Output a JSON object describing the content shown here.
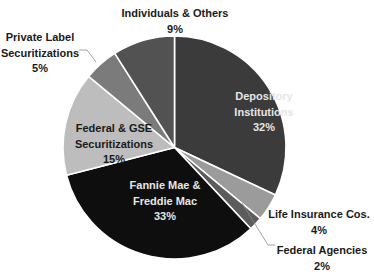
{
  "chart_data": {
    "type": "pie",
    "title": "",
    "start_angle_deg": 0,
    "direction": "clockwise",
    "slices": [
      {
        "label": "Depository Institutions",
        "lines": [
          "Depository",
          "Institutions",
          "32%"
        ],
        "value": 32,
        "color": "#3b3b3b",
        "label_color": "#e6e6e6",
        "label_pos": [
          264,
          96
        ],
        "label_inside": true
      },
      {
        "label": "Life Insurance Cos.",
        "lines": [
          "Life Insurance Cos.",
          "4%"
        ],
        "value": 4,
        "color": "#9b9b9b",
        "label_color": "#1a1a1a",
        "label_pos": [
          319,
          214
        ],
        "label_inside": false
      },
      {
        "label": "Federal Agencies",
        "lines": [
          "Federal Agencies",
          "2%"
        ],
        "value": 2,
        "color": "#5c5c5c",
        "label_color": "#1a1a1a",
        "label_pos": [
          322,
          250
        ],
        "label_inside": false,
        "leader": [
          [
            242,
            203
          ],
          [
            268,
            245
          ],
          [
            275,
            245
          ]
        ]
      },
      {
        "label": "Fannie Mae & Freddie Mac",
        "lines": [
          "Fannie Mae &",
          "Freddie Mac",
          "33%"
        ],
        "value": 33,
        "color": "#0e0e0e",
        "label_color": "#e6e6e6",
        "label_pos": [
          165,
          185
        ],
        "label_inside": true
      },
      {
        "label": "Federal & GSE Securitizations",
        "lines": [
          "Federal & GSE",
          "Securitizations",
          "15%"
        ],
        "value": 15,
        "color": "#bdbdbd",
        "label_color": "#1a1a1a",
        "label_pos": [
          114,
          128
        ],
        "label_inside": true
      },
      {
        "label": "Private Label Securitizations",
        "lines": [
          "Private Label",
          "Securitizations",
          "5%"
        ],
        "value": 5,
        "color": "#7b7b7b",
        "label_color": "#1a1a1a",
        "label_pos": [
          40,
          37
        ],
        "label_inside": false,
        "leader": [
          [
            79,
            50
          ],
          [
            87,
            50
          ],
          [
            96,
            62
          ]
        ]
      },
      {
        "label": "Individuals & Others",
        "lines": [
          "Individuals & Others",
          "9%"
        ],
        "value": 9,
        "color": "#525252",
        "label_color": "#1a1a1a",
        "label_pos": [
          175,
          13
        ],
        "label_inside": false
      }
    ],
    "legend": null,
    "center": [
      174.5,
      147.5
    ],
    "radius": 111.5
  }
}
